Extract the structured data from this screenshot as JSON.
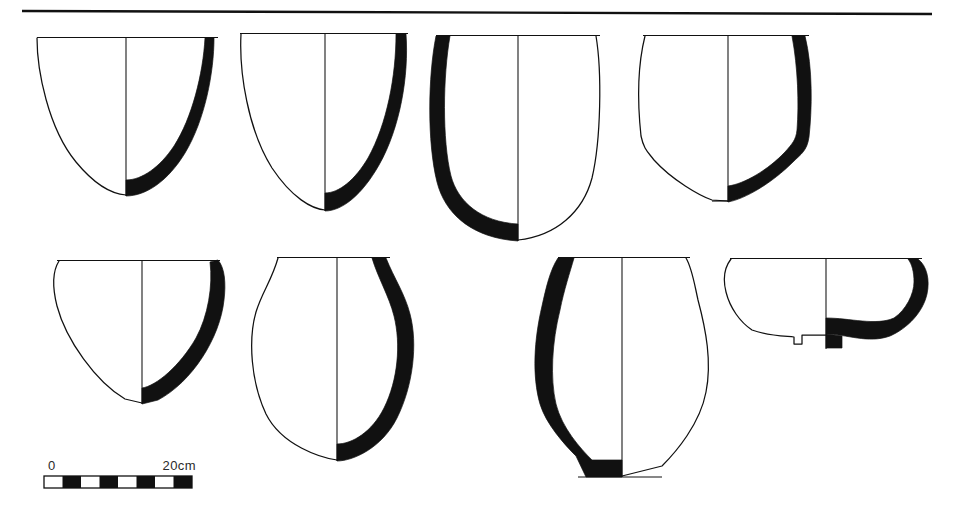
{
  "figure": {
    "kind": "archaeological-pottery-profile-plate",
    "background_color": "#ffffff",
    "ink_color": "#111111",
    "width": 957,
    "height": 511,
    "row_count": 2,
    "vessel_count": 8
  },
  "header_rule": {
    "name": "top-horizontal-rule",
    "x1": 22,
    "x2": 932,
    "y1": 11,
    "y2": 14,
    "stroke_width": 2.4
  },
  "scale_bar": {
    "label_left": "0",
    "label_right": "20cm",
    "x": 44,
    "y": 476,
    "width": 148,
    "height": 12,
    "segments": 8,
    "segment_fill_pattern": [
      "light",
      "dark",
      "light",
      "dark",
      "light",
      "dark",
      "light",
      "dark"
    ],
    "label_left_x": 48,
    "label_left_y": 470,
    "label_right_x": 192,
    "label_right_y": 470
  },
  "vessels": [
    {
      "id": 1,
      "name": "conical-bowl-pointed-base",
      "row": 1,
      "column": 1,
      "section_side": "right",
      "rim_y": 38,
      "base_y": 195,
      "rim_left_x": 37,
      "rim_right_x": 214,
      "axis_x": 126,
      "outline_path": "M 37 38 C 37 70 48 128 76 162 C 95 185 112 194 126 195",
      "rim_path": "M 37 37.5 L 216 37.5",
      "axis_path": "M 126 39 L 126 196",
      "section_path": "M 214 38 C 214 72 205 120 185 153 C 168 181 146 196 126 196 L 126 180 C 142 180 160 167 174 146 C 192 118 203 74 205 38 Z"
    },
    {
      "id": 2,
      "name": "conical-bowl-rounded-base",
      "row": 1,
      "column": 2,
      "section_side": "right",
      "rim_y": 34,
      "base_y": 210,
      "rim_left_x": 240,
      "rim_right_x": 404,
      "axis_x": 325,
      "outline_path": "M 241 34 C 239 72 248 130 272 168 C 292 198 312 209 325 210",
      "rim_path": "M 240 33.5 L 408 33.5",
      "axis_path": "M 325 35 L 325 211",
      "section_path": "M 406 34 C 409 76 400 128 379 165 C 362 195 342 211 325 211 L 325 193 C 339 193 355 180 368 158 C 387 124 396 76 396 34 Z"
    },
    {
      "id": 3,
      "name": "deep-bowl-flattened-base",
      "row": 1,
      "column": 3,
      "section_side": "left",
      "rim_y": 36,
      "base_y": 240,
      "rim_left_x": 436,
      "rim_right_x": 596,
      "axis_x": 518,
      "outline_path": "M 596 36 C 602 72 601 140 592 178 C 583 212 556 236 518 240",
      "rim_path": "M 434 35.5 L 597 35.5",
      "axis_path": "M 518 37 L 518 241",
      "section_path": "M 436 36 C 428 76 427 142 437 182 C 445 214 472 238 518 241 L 518 224 C 481 222 458 202 451 176 C 442 140 443 76 450 36 Z"
    },
    {
      "id": 4,
      "name": "flat-base-beaker",
      "row": 1,
      "column": 4,
      "section_side": "right",
      "rim_y": 36,
      "base_y": 201,
      "rim_left_x": 643,
      "rim_right_x": 805,
      "axis_x": 728,
      "outline_path": "M 645 36 C 637 68 638 108 641 136 C 644 150 648 152 654 160 C 672 180 700 196 712 200 L 728 201",
      "rim_path": "M 643 35.5 L 808 35.5",
      "axis_path": "M 728 37 L 728 202",
      "section_path": "M 805 36 C 813 68 812 110 809 137 C 807 151 801 154 793 162 C 772 183 745 199 728 202 L 728 186 C 744 184 768 170 785 152 C 792 144 796 140 797 130 C 799 104 798 68 792 36 Z"
    },
    {
      "id": 5,
      "name": "shallow-bowl-everted-rim",
      "row": 2,
      "column": 1,
      "section_side": "right",
      "rim_y": 261,
      "base_y": 403,
      "rim_left_x": 57,
      "rim_right_x": 216,
      "axis_x": 142,
      "outline_path": "M 59 261 C 52 272 53 290 57 306 C 66 340 96 382 125 399 L 142 403",
      "rim_path": "M 57 260.5 L 220 260.5",
      "axis_path": "M 142 262 L 142 404",
      "section_path": "M 218 260 C 225 268 226 284 224 300 C 220 338 192 382 158 400 L 142 404 L 142 388 C 156 386 180 366 196 338 C 208 316 213 286 210 262 Z"
    },
    {
      "id": 6,
      "name": "ovoid-jar-constricted-neck",
      "row": 2,
      "column": 2,
      "section_side": "right",
      "rim_y": 258,
      "base_y": 460,
      "rim_left_x": 277,
      "rim_right_x": 386,
      "axis_x": 337,
      "outline_path": "M 278 258 C 272 280 262 292 256 312 C 248 340 251 382 266 414 C 282 446 322 458 337 460",
      "rim_path": "M 277 257.5 L 388 257.5",
      "axis_path": "M 337 259 L 337 461",
      "section_path": "M 386 258 C 394 278 405 294 410 314 C 418 344 413 386 397 418 C 382 448 353 461 337 461 L 337 444 C 352 444 372 432 384 408 C 398 380 401 344 394 316 C 389 296 378 278 372 258 Z"
    },
    {
      "id": 7,
      "name": "globular-jar-narrow-flat-base",
      "row": 2,
      "column": 3,
      "section_side": "left",
      "rim_y": 258,
      "base_y": 476,
      "rim_left_x": 558,
      "rim_right_x": 686,
      "axis_x": 622,
      "outline_path": "M 686 258 C 692 268 694 282 698 300 C 706 330 712 362 706 392 C 700 424 676 452 662 466 L 622 476",
      "rim_path": "M 556 257.5 L 688 257.5",
      "axis_path": "M 622 259 L 622 477",
      "section_path": "M 558 258 C 550 270 546 288 542 306 C 534 340 532 376 540 404 C 546 424 564 444 576 456 L 586 477 L 622 477 L 622 460 L 592 460 C 580 448 562 428 556 404 C 550 378 552 342 560 310 C 564 290 570 272 574 258 Z"
    },
    {
      "id": 8,
      "name": "shallow-bowl-ring-foot",
      "row": 2,
      "column": 4,
      "section_side": "right",
      "rim_y": 259,
      "base_y": 348,
      "rim_left_x": 730,
      "rim_right_x": 918,
      "axis_x": 826,
      "outline_path": "M 731 259 C 724 268 723 280 726 292 C 730 308 740 322 752 330 C 768 336 784 336 794 337 L 794 344 L 802 344 L 802 335 L 826 335",
      "rim_path": "M 730 258.5 L 922 258.5",
      "axis_path": "M 826 260 L 826 336",
      "section_path": "M 918 259 C 927 266 930 280 927 294 C 923 312 908 328 890 336 C 868 344 846 334 826 334 L 826 318 C 850 318 876 326 894 318 C 906 310 914 294 914 282 C 914 272 912 264 908 259 Z",
      "foot_path": "M 826 334 L 826 348 L 842 348 L 842 336 Z"
    }
  ]
}
